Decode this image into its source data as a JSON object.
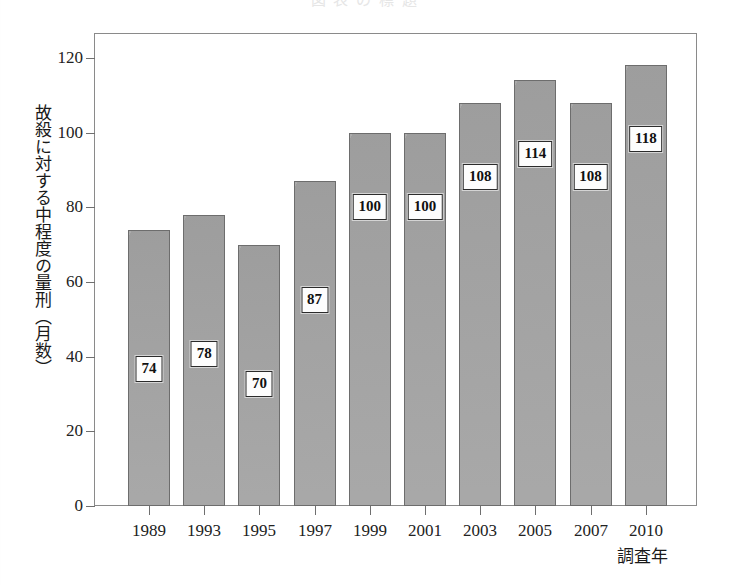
{
  "chart_data": {
    "type": "bar",
    "title": "",
    "xlabel": "調査年",
    "ylabel": "故殺に対する中程度の量刑（月数）",
    "categories": [
      "1989",
      "1993",
      "1995",
      "1997",
      "1999",
      "2001",
      "2003",
      "2005",
      "2007",
      "2010"
    ],
    "values": [
      74,
      78,
      70,
      87,
      100,
      100,
      108,
      114,
      108,
      118
    ],
    "value_labels": [
      "74",
      "78",
      "70",
      "87",
      "100",
      "100",
      "108",
      "114",
      "108",
      "118"
    ],
    "ylim": [
      0,
      125
    ],
    "yticks": [
      0,
      20,
      40,
      60,
      80,
      100,
      120
    ],
    "ytick_labels": [
      "0",
      "20",
      "40",
      "60",
      "80",
      "100",
      "120"
    ],
    "grid": false,
    "legend": "none",
    "series": [
      {
        "name": "故殺に対する中程度の量刑（月数）",
        "values": [
          74,
          78,
          70,
          87,
          100,
          100,
          108,
          114,
          108,
          118
        ]
      }
    ],
    "bar_color": "#a9a9a9",
    "bar_border_color": "#6d6d6d",
    "label_box_background": "#fdfdfd",
    "label_box_border": "#2b2b2b",
    "axis_color": "#8a8a8a"
  },
  "axes": {
    "y_title": "故殺に対する中程度の量刑（月数）",
    "x_title": "調査年"
  },
  "title_strip": {
    "text": "図  表  の  標  題"
  }
}
